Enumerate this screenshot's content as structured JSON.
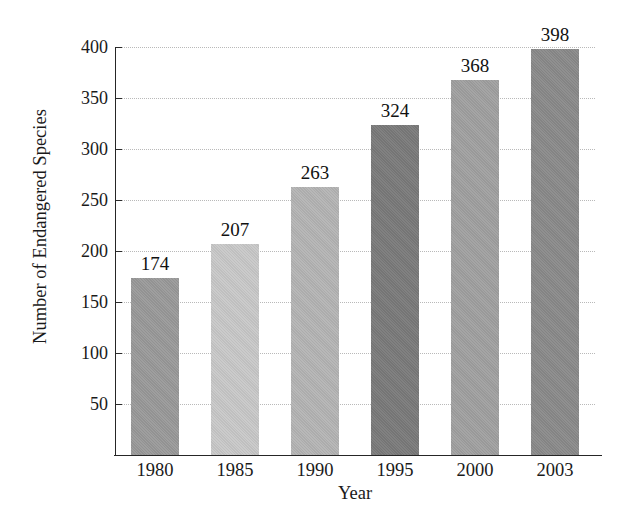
{
  "chart_data": {
    "type": "bar",
    "title": "",
    "xlabel": "Year",
    "ylabel": "Number of Endangered Species",
    "categories": [
      "1980",
      "1985",
      "1990",
      "1995",
      "2000",
      "2003"
    ],
    "values": [
      174,
      207,
      263,
      324,
      368,
      398
    ],
    "value_labels": [
      "174",
      "207",
      "263",
      "324",
      "368",
      "398"
    ],
    "bar_colors": [
      "#999999",
      "#c8c8c8",
      "#b4b4b4",
      "#7a7a7a",
      "#a0a0a0",
      "#8a8a8a"
    ],
    "ylim": [
      0,
      400
    ],
    "yticks": [
      50,
      100,
      150,
      200,
      250,
      300,
      350,
      400
    ],
    "ytick_labels": [
      "50",
      "100",
      "150",
      "200",
      "250",
      "300",
      "350",
      "400"
    ],
    "grid": "horizontal-dotted",
    "legend": "none",
    "axis_color": "#262626",
    "gridline_color": "#b9b9b9",
    "background": "#ffffff"
  }
}
